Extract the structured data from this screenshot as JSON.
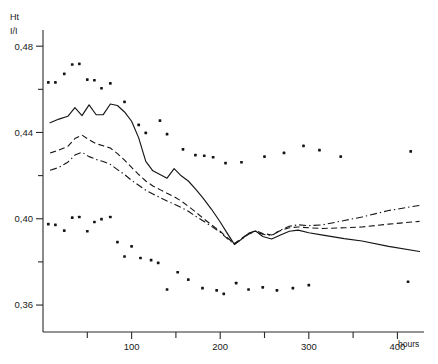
{
  "chart_data": {
    "type": "line",
    "title": "",
    "subtitle": "",
    "ylabel_top": "Ht",
    "ylabel_bottom": "I/I",
    "xlabel": "hours",
    "xlim": [
      0,
      430
    ],
    "ylim": [
      0.3475,
      0.4875
    ],
    "grid": false,
    "legend": "none",
    "y_ticks_major": [
      0.48,
      0.44,
      0.4,
      0.36
    ],
    "y_tick_labels": [
      "0,48",
      "0,44",
      "0,40",
      "0,36"
    ],
    "y_ticks_minor": [
      0.46,
      0.42,
      0.38
    ],
    "x_ticks_major": [
      100,
      200,
      300,
      400
    ],
    "x_tick_labels": [
      "100",
      "200",
      "300",
      "400"
    ],
    "x_ticks_minor": [
      50,
      150,
      250,
      350
    ],
    "series": [
      {
        "name": "solid-curve",
        "style": "solid",
        "x": [
          8,
          18,
          28,
          36,
          44,
          52,
          60,
          68,
          76,
          84,
          92,
          100,
          108,
          116,
          124,
          132,
          140,
          148,
          156,
          164,
          172,
          180,
          190,
          200,
          208,
          216,
          224,
          232,
          240,
          248,
          258,
          268,
          278,
          288,
          300,
          316,
          340,
          360,
          390,
          425
        ],
        "y": [
          0.4445,
          0.4462,
          0.4475,
          0.4515,
          0.4478,
          0.4528,
          0.4482,
          0.4483,
          0.4532,
          0.4525,
          0.4495,
          0.4452,
          0.4375,
          0.4266,
          0.4222,
          0.4205,
          0.4188,
          0.4232,
          0.4199,
          0.4175,
          0.4138,
          0.4099,
          0.4045,
          0.3985,
          0.3932,
          0.3881,
          0.3905,
          0.3932,
          0.3943,
          0.3918,
          0.3906,
          0.3925,
          0.3942,
          0.3947,
          0.3935,
          0.3924,
          0.3908,
          0.3897,
          0.3872,
          0.3848
        ]
      },
      {
        "name": "dashed-curve",
        "style": "dashed",
        "x": [
          8,
          18,
          28,
          36,
          44,
          52,
          60,
          68,
          76,
          84,
          92,
          100,
          108,
          116,
          124,
          132,
          140,
          148,
          156,
          164,
          172,
          180,
          190,
          200,
          208,
          216,
          224,
          232,
          240,
          248,
          258,
          268,
          278,
          288,
          300,
          316,
          340,
          360,
          390,
          425
        ],
        "y": [
          0.4305,
          0.4318,
          0.4335,
          0.4372,
          0.4388,
          0.4366,
          0.4348,
          0.4338,
          0.4328,
          0.4302,
          0.4272,
          0.4238,
          0.4205,
          0.4175,
          0.4152,
          0.4135,
          0.4118,
          0.4102,
          0.4082,
          0.4058,
          0.4032,
          0.4005,
          0.3972,
          0.3942,
          0.3912,
          0.3885,
          0.3908,
          0.3932,
          0.3945,
          0.3932,
          0.3925,
          0.3945,
          0.3958,
          0.3962,
          0.3958,
          0.3955,
          0.3958,
          0.3962,
          0.3975,
          0.3988
        ]
      },
      {
        "name": "dashdot-curve",
        "style": "dashdot",
        "x": [
          8,
          18,
          28,
          36,
          44,
          52,
          60,
          68,
          76,
          84,
          92,
          100,
          108,
          116,
          124,
          132,
          140,
          148,
          156,
          164,
          172,
          180,
          190,
          200,
          208,
          216,
          224,
          232,
          240,
          248,
          258,
          268,
          278,
          288,
          300,
          316,
          340,
          360,
          390,
          425
        ],
        "y": [
          0.4225,
          0.4238,
          0.4262,
          0.4295,
          0.4308,
          0.4288,
          0.4275,
          0.4265,
          0.4252,
          0.4228,
          0.4205,
          0.4178,
          0.4155,
          0.4132,
          0.4115,
          0.4098,
          0.4082,
          0.4068,
          0.4052,
          0.4035,
          0.4012,
          0.3992,
          0.3965,
          0.3938,
          0.3908,
          0.3882,
          0.3905,
          0.3928,
          0.3942,
          0.3928,
          0.3922,
          0.3948,
          0.3965,
          0.3972,
          0.3968,
          0.3972,
          0.3992,
          0.4008,
          0.4038,
          0.4062
        ]
      }
    ],
    "scatter_upper": {
      "name": "upper-band-points",
      "points": [
        [
          6,
          0.4632
        ],
        [
          14,
          0.4632
        ],
        [
          24,
          0.4672
        ],
        [
          33,
          0.4715
        ],
        [
          41,
          0.4718
        ],
        [
          50,
          0.4645
        ],
        [
          58,
          0.4642
        ],
        [
          66,
          0.4605
        ],
        [
          76,
          0.4628
        ],
        [
          92,
          0.4542
        ],
        [
          108,
          0.4435
        ],
        [
          116,
          0.4398
        ],
        [
          132,
          0.4455
        ],
        [
          140,
          0.4392
        ],
        [
          158,
          0.4322
        ],
        [
          172,
          0.4295
        ],
        [
          182,
          0.4292
        ],
        [
          192,
          0.4285
        ],
        [
          206,
          0.4258
        ],
        [
          224,
          0.4262
        ],
        [
          250,
          0.4288
        ],
        [
          272,
          0.4305
        ],
        [
          294,
          0.4338
        ],
        [
          312,
          0.4318
        ],
        [
          336,
          0.4288
        ],
        [
          415,
          0.4312
        ]
      ]
    },
    "scatter_lower": {
      "name": "lower-band-points",
      "points": [
        [
          6,
          0.3975
        ],
        [
          14,
          0.3972
        ],
        [
          24,
          0.3945
        ],
        [
          33,
          0.4005
        ],
        [
          41,
          0.4008
        ],
        [
          50,
          0.3942
        ],
        [
          58,
          0.3985
        ],
        [
          66,
          0.3998
        ],
        [
          76,
          0.4008
        ],
        [
          84,
          0.3892
        ],
        [
          92,
          0.3825
        ],
        [
          100,
          0.3872
        ],
        [
          110,
          0.3818
        ],
        [
          122,
          0.3808
        ],
        [
          130,
          0.3795
        ],
        [
          140,
          0.3672
        ],
        [
          152,
          0.3752
        ],
        [
          164,
          0.3718
        ],
        [
          180,
          0.3678
        ],
        [
          196,
          0.3668
        ],
        [
          204,
          0.3652
        ],
        [
          218,
          0.3702
        ],
        [
          232,
          0.3672
        ],
        [
          248,
          0.3682
        ],
        [
          264,
          0.3668
        ],
        [
          282,
          0.3678
        ],
        [
          300,
          0.3692
        ],
        [
          412,
          0.3708
        ]
      ]
    }
  },
  "axis": {
    "y_title_top": "Ht",
    "y_title_bottom": "I/I",
    "x_unit": "hours"
  },
  "colors": {
    "axis": "#2a2a2a",
    "series": "#151515",
    "point": "#141414",
    "background": "#ffffff"
  }
}
